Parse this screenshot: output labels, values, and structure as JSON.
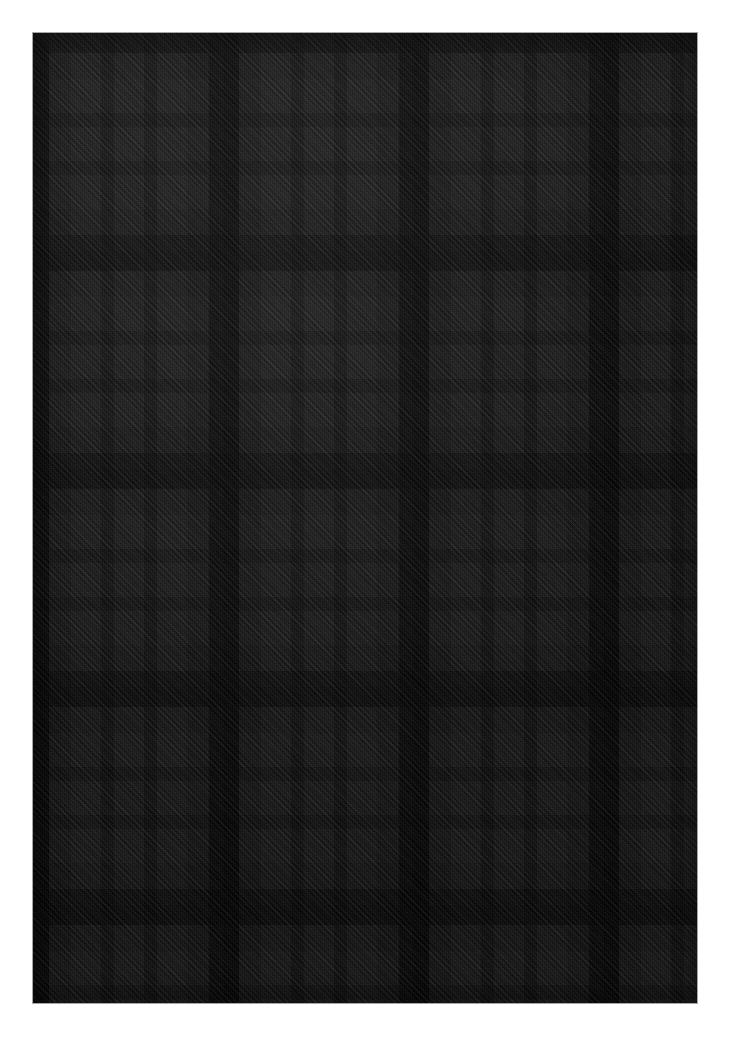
{
  "canvas": {
    "width": 729,
    "height": 1039,
    "background": "#ffffff"
  },
  "swatch": {
    "label": "tartan-fabric-swatch",
    "x": 33,
    "y": 33,
    "width": 664,
    "height": 970,
    "base_color": "#3a3a3a",
    "weave": "2/2 twill, 45 degree diagonal",
    "sett_width_px": 190,
    "sett_height_px": 218
  },
  "palette": {
    "black": "#0a0a0a",
    "near_black": "#141414",
    "very_dark": "#1d1d1d",
    "dark": "#262626",
    "mid_dark": "#2f2f2f",
    "charcoal": "#383838",
    "light_charcoal": "#424242",
    "lightest": "#4a4a4a"
  },
  "warp_stripes": [
    {
      "name": "black-bar",
      "start": 0,
      "width": 16,
      "color": "#0a0a0a"
    },
    {
      "name": "charcoal-field-a",
      "start": 16,
      "width": 22,
      "color": "#383838"
    },
    {
      "name": "light-block-1",
      "start": 38,
      "width": 30,
      "color": "#444444"
    },
    {
      "name": "mid-stripe-1",
      "start": 68,
      "width": 13,
      "color": "#2c2c2c"
    },
    {
      "name": "light-block-2",
      "start": 81,
      "width": 30,
      "color": "#444444"
    },
    {
      "name": "mid-stripe-2",
      "start": 111,
      "width": 13,
      "color": "#2c2c2c"
    },
    {
      "name": "light-block-3",
      "start": 124,
      "width": 30,
      "color": "#444444"
    },
    {
      "name": "charcoal-field-b",
      "start": 154,
      "width": 22,
      "color": "#383838"
    },
    {
      "name": "thin-black-line",
      "start": 176,
      "width": 14,
      "color": "#121212"
    }
  ],
  "weft_stripes": [
    {
      "name": "black-band",
      "start": 0,
      "height": 20,
      "color": "#0c0c0c"
    },
    {
      "name": "charcoal-row-a",
      "start": 20,
      "height": 26,
      "color": "#383838"
    },
    {
      "name": "light-row-1",
      "start": 46,
      "height": 34,
      "color": "#444444"
    },
    {
      "name": "mid-row-1",
      "start": 80,
      "height": 14,
      "color": "#2c2c2c"
    },
    {
      "name": "light-row-2",
      "start": 94,
      "height": 34,
      "color": "#444444"
    },
    {
      "name": "mid-row-2",
      "start": 128,
      "height": 14,
      "color": "#2c2c2c"
    },
    {
      "name": "light-row-3",
      "start": 142,
      "height": 34,
      "color": "#444444"
    },
    {
      "name": "charcoal-row-b",
      "start": 176,
      "height": 26,
      "color": "#383838"
    },
    {
      "name": "thin-black-stripe",
      "start": 202,
      "height": 16,
      "color": "#141414"
    }
  ],
  "lighting": {
    "highlight_corner": "upper-left",
    "vignette": true
  }
}
